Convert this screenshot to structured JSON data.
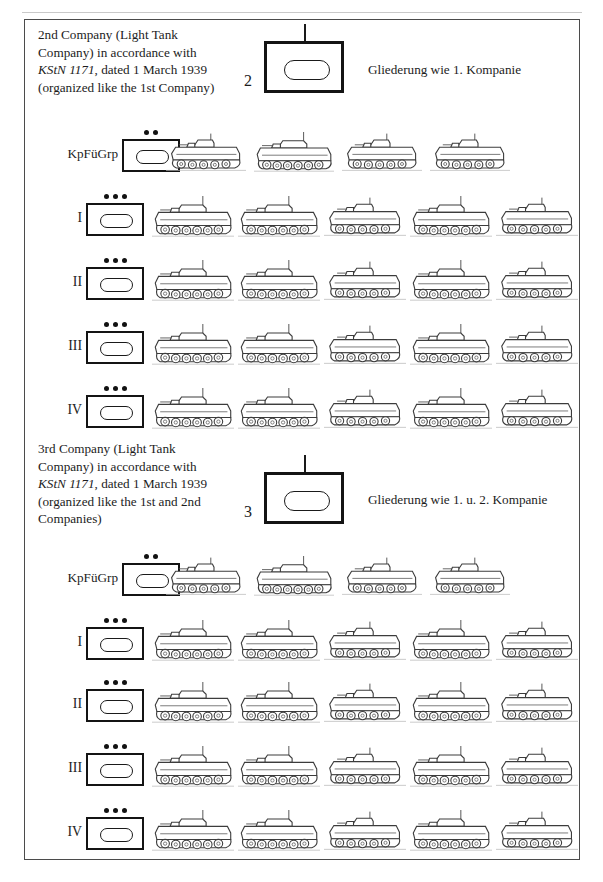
{
  "page": {
    "width": 603,
    "height": 882,
    "background": "#ffffff",
    "frame_color": "#4b4b4b",
    "ink_color": "#1a1a1a",
    "header_left_mark": "",
    "header_right_mark": ""
  },
  "chart_data": {
    "type": "diagram",
    "legend": [],
    "sections": [
      {
        "id": "company-2",
        "number": "2",
        "description_lines": [
          "2nd Company (Light Tank",
          "Company) in accordance with",
          "KStN 1171, dated 1 March 1939",
          "(organized like the 1st Company)"
        ],
        "italic_fragment": "KStN 1171",
        "note": "Gliederung wie 1. Kompanie",
        "symbol": {
          "shape": "armor-box-with-oval",
          "echelon_dots": 0,
          "stem": true
        },
        "rows": [
          {
            "label": "KpFüGrp",
            "label_type": "text",
            "echelon_dots": 2,
            "tank_count": 4,
            "tank_types": [
              "panzer-1",
              "panzer-2",
              "panzer-1",
              "panzer-1"
            ],
            "spacing": "wide"
          },
          {
            "label": "I",
            "label_type": "roman",
            "echelon_dots": 3,
            "tank_count": 5,
            "tank_types": [
              "panzer-2",
              "panzer-2",
              "panzer-1",
              "panzer-2",
              "panzer-1"
            ],
            "spacing": "normal"
          },
          {
            "label": "II",
            "label_type": "roman",
            "echelon_dots": 3,
            "tank_count": 5,
            "tank_types": [
              "panzer-2",
              "panzer-2",
              "panzer-1",
              "panzer-2",
              "panzer-1"
            ],
            "spacing": "normal"
          },
          {
            "label": "III",
            "label_type": "roman",
            "echelon_dots": 3,
            "tank_count": 5,
            "tank_types": [
              "panzer-2",
              "panzer-2",
              "panzer-1",
              "panzer-2",
              "panzer-1"
            ],
            "spacing": "normal"
          },
          {
            "label": "IV",
            "label_type": "roman",
            "echelon_dots": 3,
            "tank_count": 5,
            "tank_types": [
              "panzer-2",
              "panzer-2",
              "panzer-1",
              "panzer-2",
              "panzer-1"
            ],
            "spacing": "normal"
          }
        ]
      },
      {
        "id": "company-3",
        "number": "3",
        "description_lines": [
          "3rd Company (Light Tank",
          "Company) in accordance with",
          "KStN 1171, dated 1 March 1939",
          "(organized like the 1st and 2nd",
          "Companies)"
        ],
        "italic_fragment": "KStN 1171",
        "note": "Gliederung wie 1. u. 2. Kompanie",
        "symbol": {
          "shape": "armor-box-with-oval",
          "echelon_dots": 0,
          "stem": true
        },
        "rows": [
          {
            "label": "KpFüGrp",
            "label_type": "text",
            "echelon_dots": 2,
            "tank_count": 4,
            "tank_types": [
              "panzer-1",
              "panzer-2",
              "panzer-1",
              "panzer-1"
            ],
            "spacing": "wide"
          },
          {
            "label": "I",
            "label_type": "roman",
            "echelon_dots": 3,
            "tank_count": 5,
            "tank_types": [
              "panzer-2",
              "panzer-2",
              "panzer-1",
              "panzer-2",
              "panzer-1"
            ],
            "spacing": "normal"
          },
          {
            "label": "II",
            "label_type": "roman",
            "echelon_dots": 3,
            "tank_count": 5,
            "tank_types": [
              "panzer-2",
              "panzer-2",
              "panzer-1",
              "panzer-2",
              "panzer-1"
            ],
            "spacing": "normal"
          },
          {
            "label": "III",
            "label_type": "roman",
            "echelon_dots": 3,
            "tank_count": 5,
            "tank_types": [
              "panzer-2",
              "panzer-2",
              "panzer-1",
              "panzer-2",
              "panzer-1"
            ],
            "spacing": "normal"
          },
          {
            "label": "IV",
            "label_type": "roman",
            "echelon_dots": 3,
            "tank_count": 5,
            "tank_types": [
              "panzer-2",
              "panzer-2",
              "panzer-1",
              "panzer-2",
              "panzer-1"
            ],
            "spacing": "normal"
          }
        ]
      }
    ]
  },
  "layout": {
    "sections": [
      {
        "text_left": 38,
        "text_top": 26,
        "symbol_left": 248,
        "symbol_top": 24,
        "note_left": 368,
        "note_top": 62,
        "rows": [
          {
            "top": 128,
            "label_right": 118,
            "sym_left": 122,
            "tanks_left": 166,
            "tank_gap": 88,
            "tank_w": 80
          },
          {
            "top": 192,
            "label_right": 82,
            "sym_left": 86,
            "tanks_left": 152,
            "tank_gap": 86,
            "tank_w": 82
          },
          {
            "top": 256,
            "label_right": 82,
            "sym_left": 86,
            "tanks_left": 152,
            "tank_gap": 86,
            "tank_w": 82
          },
          {
            "top": 320,
            "label_right": 82,
            "sym_left": 86,
            "tanks_left": 152,
            "tank_gap": 86,
            "tank_w": 82
          },
          {
            "top": 384,
            "label_right": 82,
            "sym_left": 86,
            "tanks_left": 152,
            "tank_gap": 86,
            "tank_w": 82
          }
        ]
      },
      {
        "text_left": 38,
        "text_top": 440,
        "symbol_left": 248,
        "symbol_top": 455,
        "note_left": 368,
        "note_top": 492,
        "rows": [
          {
            "top": 552,
            "label_right": 118,
            "sym_left": 122,
            "tanks_left": 166,
            "tank_gap": 88,
            "tank_w": 80
          },
          {
            "top": 616,
            "label_right": 82,
            "sym_left": 86,
            "tanks_left": 152,
            "tank_gap": 86,
            "tank_w": 82
          },
          {
            "top": 678,
            "label_right": 82,
            "sym_left": 86,
            "tanks_left": 152,
            "tank_gap": 86,
            "tank_w": 82
          },
          {
            "top": 742,
            "label_right": 82,
            "sym_left": 86,
            "tanks_left": 152,
            "tank_gap": 86,
            "tank_w": 82
          },
          {
            "top": 806,
            "label_right": 82,
            "sym_left": 86,
            "tanks_left": 152,
            "tank_gap": 86,
            "tank_w": 82
          }
        ]
      }
    ]
  }
}
